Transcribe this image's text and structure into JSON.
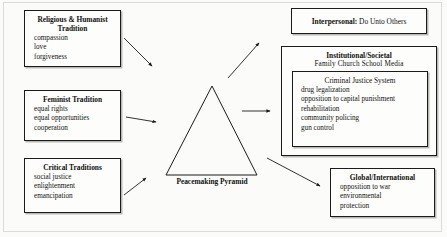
{
  "figure": {
    "title": "Peacemaking Pyramid",
    "center_label": "Peacemaking Pyramid"
  },
  "sources": [
    {
      "title": "Religious & Humanist Tradition",
      "items": [
        "compassion",
        "love",
        "forgiveness"
      ]
    },
    {
      "title": "Feminist Tradition",
      "items": [
        "equal rights",
        "equal opportunities",
        "cooperation"
      ]
    },
    {
      "title": "Critical Traditions",
      "items": [
        "social justice",
        "enlightenment",
        "emancipation"
      ]
    }
  ],
  "levels": {
    "interpersonal": {
      "label": "Interpersonal:",
      "text": "Do Unto Others"
    },
    "institutional": {
      "title": "Institutional/Societal",
      "subtitle": "Family   Church   School   Media",
      "inner": {
        "title": "Criminal Justice System",
        "items": [
          "drug legalization",
          "opposition to capital punishment",
          "rehabilitation",
          "community policing",
          "gun control"
        ]
      }
    },
    "global": {
      "title": "Global/International",
      "items": [
        "opposition to war",
        "environmental",
        "protection"
      ]
    }
  },
  "colors": {
    "background": "#fbfbf9",
    "line": "#1b1b1b",
    "shadow": "#b9b9b4",
    "frame": "#dcdcd6"
  }
}
